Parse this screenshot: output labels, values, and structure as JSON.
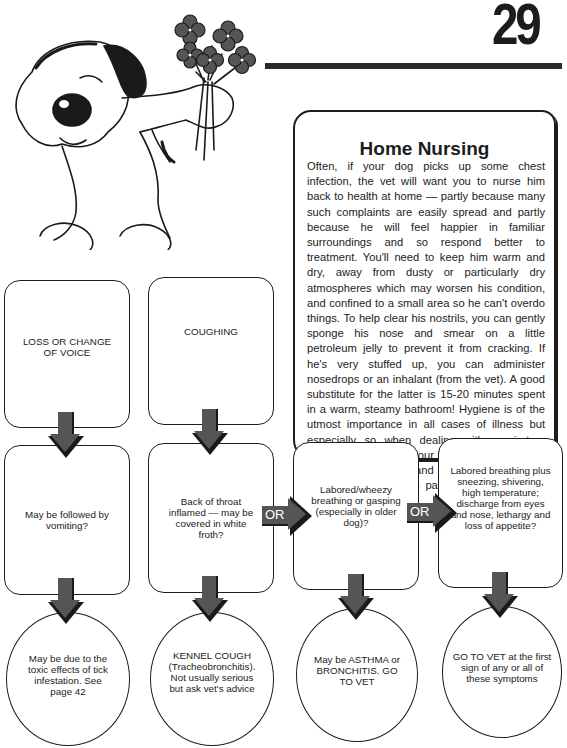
{
  "page": {
    "number": "29"
  },
  "illustration": {
    "description": "Cartoon dog holding a bouquet of flowers",
    "flower_color": "#555555"
  },
  "home_nursing": {
    "title": "Home Nursing",
    "body": "Often, if your dog picks up some chest infection, the vet will want you to nurse him back to health at home — partly because many such complaints are easily spread and partly because he will feel happier in familiar surroundings and so respond better to treatment. You'll need to keep him warm and dry, away from dusty or particularly dry atmospheres which may worsen his condition, and confined to a small area so he can't overdo things. To help clear his nostrils, you can gently sponge his nose and smear on a little petroleum jelly to prevent it from cracking. If he's very stuffed up, you can administer nosedrops or an inhalant (from the vet). A good substitute for the latter is 15-20 minutes spent in a warm, steamy bathroom! Hygiene is of the utmost importance in all cases of illness but especially so when dealing with respiratory complaints, so wash your hands every time you handle the dog and keep his dishes scrupulously clean — particularly if there are other dogs around."
  },
  "flowchart": {
    "arrow_color": "#555555",
    "symptoms": [
      {
        "label": "LOSS OR CHANGE OF VOICE"
      },
      {
        "label": "COUGHING"
      }
    ],
    "questions": [
      {
        "label": "May be followed by vomiting?"
      },
      {
        "label": "Back of throat inflamed — may be covered in white froth?"
      },
      {
        "label": "Labored/wheezy breathing or gasping (especially in older dog)?"
      },
      {
        "label": "Labored breathing plus sneezing, shivering, high temperature; discharge from eyes and nose, lethargy and loss of appetite?"
      }
    ],
    "or_connectors": [
      {
        "label": "OR"
      },
      {
        "label": "OR"
      }
    ],
    "outcomes": [
      {
        "label": "May be due to the toxic effects of tick infestation. See page 42"
      },
      {
        "label": "KENNEL COUGH (Tracheobronchitis). Not usually serious but ask vet's advice"
      },
      {
        "label": "May be ASTHMA or BRONCHITIS. GO TO VET"
      },
      {
        "label": "GO TO VET at the first sign of any or all of these symptoms"
      }
    ]
  }
}
